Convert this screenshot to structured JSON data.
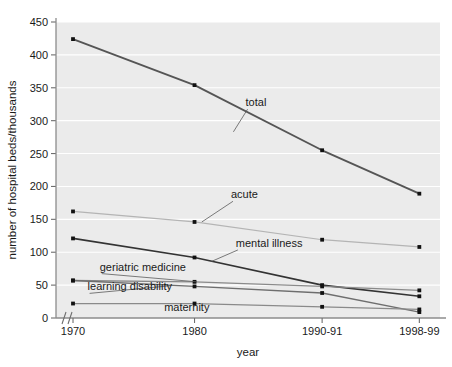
{
  "chart_data": {
    "type": "line",
    "title": "",
    "xlabel": "year",
    "ylabel": "number of hospital beds/thousands",
    "categories": [
      "1970",
      "1980",
      "1990-91",
      "1998-99"
    ],
    "x_tick_labels": [
      "1970",
      "1980",
      "1990-91",
      "1998-99"
    ],
    "y_tick_labels": [
      "0",
      "50",
      "100",
      "150",
      "200",
      "250",
      "300",
      "350",
      "400",
      "450"
    ],
    "ylim": [
      0,
      450
    ],
    "y_tick_step": 50,
    "grid": "horizontal-white-gridlines",
    "legend": "inline-labels-with-leader-lines",
    "axis_break": true,
    "axis_break_symbol": "//",
    "series": [
      {
        "name": "total",
        "label": "total",
        "color": "#555555",
        "width": 1.9,
        "values": [
          424,
          354,
          255,
          189
        ],
        "label_x": 1984.2,
        "label_y": 322,
        "leader_to_x": 1983.2,
        "leader_to_y": 283
      },
      {
        "name": "acute",
        "label": "acute",
        "color": "#b4b4b4",
        "width": 1.2,
        "values": [
          162,
          146,
          119,
          108
        ],
        "label_x": 1983.0,
        "label_y": 182,
        "leader_to_x": 1980.6,
        "leader_to_y": 146
      },
      {
        "name": "mental illness",
        "label": "mental illness",
        "color": "#333333",
        "width": 1.6,
        "values": [
          121,
          92,
          50,
          33
        ],
        "label_x": 1983.4,
        "label_y": 108,
        "leader_to_x": 1981.4,
        "leader_to_y": 86
      },
      {
        "name": "geriatric medicine",
        "label": "geriatric medicine",
        "color": "#8a8a8a",
        "width": 1.3,
        "values": [
          57,
          55,
          48,
          42
        ],
        "label_x": 1972.2,
        "label_y": 72,
        "leader_to_x": 1980.2,
        "leader_to_y": 55
      },
      {
        "name": "learning disability",
        "label": "learning disability",
        "color": "#6e6e6e",
        "width": 1.3,
        "values": [
          57,
          48,
          38,
          9
        ],
        "label_x": 1971.2,
        "label_y": 42,
        "leader_to_x": 1978.0,
        "leader_to_y": 49
      },
      {
        "name": "maternity",
        "label": "maternity",
        "color": "#8a8a8a",
        "width": 1.3,
        "values": [
          22,
          22,
          17,
          13
        ],
        "label_x": 1977.5,
        "label_y": 10,
        "leader_to_x": null,
        "leader_to_y": null
      }
    ]
  },
  "figure": {
    "y_axis_title": "number of hospital beds/thousands",
    "x_axis_title": "year"
  }
}
